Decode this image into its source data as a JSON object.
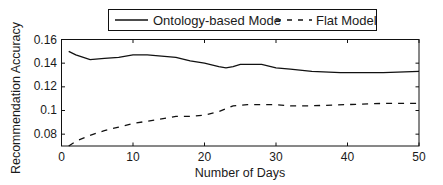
{
  "chart_data": {
    "type": "line",
    "title": "",
    "xlabel": "Number of Days",
    "ylabel": "Recommendation Accuracy",
    "xlim": [
      0,
      50
    ],
    "ylim": [
      0.07,
      0.16
    ],
    "xticks": [
      0,
      10,
      20,
      30,
      40,
      50
    ],
    "xtick_labels": [
      "0",
      "10",
      "20",
      "30",
      "40",
      "50"
    ],
    "yticks": [
      0.08,
      0.1,
      0.12,
      0.14,
      0.16
    ],
    "ytick_labels": [
      "0.08",
      "0.1",
      "0.12",
      "0.14",
      "0.16"
    ],
    "grid": false,
    "legend_position": "top-outside",
    "series": [
      {
        "name": "Ontology-based Mode",
        "style": "solid",
        "color": "#111111",
        "x": [
          1,
          2,
          4,
          6,
          8,
          10,
          12,
          14,
          16,
          18,
          20,
          22,
          23,
          24,
          25,
          28,
          30,
          32,
          35,
          39,
          45,
          50
        ],
        "values": [
          0.15,
          0.147,
          0.143,
          0.144,
          0.145,
          0.147,
          0.147,
          0.146,
          0.145,
          0.142,
          0.14,
          0.137,
          0.136,
          0.137,
          0.139,
          0.139,
          0.136,
          0.135,
          0.133,
          0.132,
          0.132,
          0.133
        ]
      },
      {
        "name": "Flat Model",
        "style": "dashed",
        "color": "#111111",
        "x": [
          1,
          2,
          4,
          6,
          8,
          10,
          12,
          14,
          16,
          18,
          20,
          22,
          24,
          26,
          28,
          30,
          32,
          35,
          40,
          45,
          50
        ],
        "values": [
          0.07,
          0.074,
          0.079,
          0.083,
          0.086,
          0.089,
          0.091,
          0.093,
          0.095,
          0.095,
          0.096,
          0.099,
          0.104,
          0.105,
          0.105,
          0.105,
          0.104,
          0.104,
          0.105,
          0.106,
          0.106
        ]
      }
    ]
  },
  "legend": {
    "items": [
      {
        "label": "Ontology-based Mode",
        "style": "solid"
      },
      {
        "label": "Flat Model",
        "style": "dashed"
      }
    ]
  },
  "axes": {
    "xlabel": "Number of Days",
    "ylabel": "Recommendation Accuracy",
    "xtick_labels": [
      "0",
      "10",
      "20",
      "30",
      "40",
      "50"
    ],
    "ytick_labels": [
      "0.08",
      "0.1",
      "0.12",
      "0.14",
      "0.16"
    ]
  }
}
